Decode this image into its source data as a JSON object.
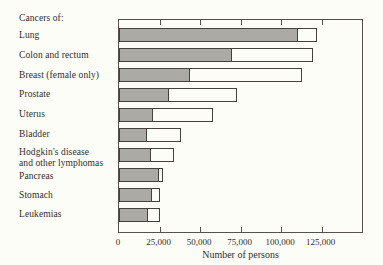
{
  "chart_data": {
    "type": "bar",
    "orientation": "horizontal",
    "stacked": true,
    "title": "Cancers of:",
    "xlabel": "Number of persons",
    "xlim": [
      0,
      150000
    ],
    "xticks": [
      0,
      25000,
      50000,
      75000,
      100000,
      125000
    ],
    "xtick_labels": [
      "0",
      "25,000",
      "50,000",
      "75,000",
      "100,000",
      "125,000"
    ],
    "grid": false,
    "legend": "none",
    "categories": [
      "Lung",
      "Colon and rectum",
      "Breast (female only)",
      "Prostate",
      "Uterus",
      "Bladder",
      "Hodgkin's disease and other lymphomas",
      "Pancreas",
      "Stomach",
      "Leukemias"
    ],
    "category_label_lines": [
      [
        "Lung"
      ],
      [
        "Colon and rectum"
      ],
      [
        "Breast (female only)"
      ],
      [
        "Prostate"
      ],
      [
        "Uterus"
      ],
      [
        "Bladder"
      ],
      [
        "Hodgkin's disease",
        "and other lymphomas"
      ],
      [
        "Pancreas"
      ],
      [
        "Stomach"
      ],
      [
        "Leukemias"
      ]
    ],
    "series": [
      {
        "name": "shaded segment (gray)",
        "color": "#abaaa4",
        "values": [
          111000,
          70000,
          44000,
          31000,
          21000,
          17000,
          20000,
          25000,
          21000,
          18000
        ]
      },
      {
        "name": "open segment (white)",
        "color": "#fdfdf8",
        "values": [
          11000,
          50000,
          69000,
          42000,
          37000,
          21000,
          14000,
          2000,
          4000,
          7000
        ]
      }
    ],
    "totals": [
      122000,
      120000,
      113000,
      73000,
      58000,
      38000,
      34000,
      27000,
      25000,
      25000
    ],
    "colors": {
      "background": "#fdfdf8",
      "bar_border": "#45423c",
      "axis_border": "#55524b",
      "text": "#2f2d29"
    }
  }
}
